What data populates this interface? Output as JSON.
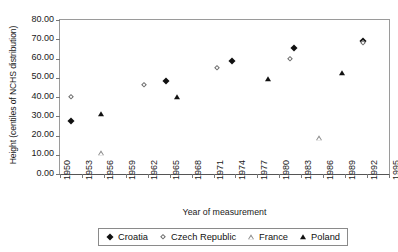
{
  "chart_data": {
    "type": "scatter",
    "title": "",
    "xlabel": "Year of measurement",
    "ylabel": "Height (centiles of NCHS distribution)",
    "xlim": [
      1950,
      1995
    ],
    "ylim": [
      0,
      80
    ],
    "grid": false,
    "legend_position": "bottom",
    "x_ticks": [
      "1950",
      "1953",
      "1956",
      "1959",
      "1962",
      "1965",
      "1968",
      "1971",
      "1974",
      "1977",
      "1980",
      "1983",
      "1986",
      "1989",
      "1992",
      "1995"
    ],
    "y_ticks": [
      "0.00",
      "10.00",
      "20.00",
      "30.00",
      "40.00",
      "50.00",
      "60.00",
      "70.00",
      "80.00"
    ],
    "series": [
      {
        "name": "Croatia",
        "marker": "diamond-filled",
        "color": "#111111",
        "points": [
          {
            "x": 1951.5,
            "y": 27.5
          },
          {
            "x": 1964.5,
            "y": 48.5
          },
          {
            "x": 1973.5,
            "y": 58.5
          },
          {
            "x": 1982.0,
            "y": 65.5
          },
          {
            "x": 1991.5,
            "y": 69.0
          }
        ]
      },
      {
        "name": "Czech Republic",
        "marker": "diamond-open",
        "color": "#6b6b6b",
        "points": [
          {
            "x": 1951.5,
            "y": 40.0
          },
          {
            "x": 1961.5,
            "y": 46.0
          },
          {
            "x": 1971.5,
            "y": 55.0
          },
          {
            "x": 1981.5,
            "y": 59.5
          },
          {
            "x": 1991.5,
            "y": 68.0
          }
        ]
      },
      {
        "name": "France",
        "marker": "triangle-open",
        "color": "#8a8a8a",
        "points": [
          {
            "x": 1955.6,
            "y": 11.0
          },
          {
            "x": 1985.4,
            "y": 18.5
          }
        ]
      },
      {
        "name": "Poland",
        "marker": "triangle-filled",
        "color": "#111111",
        "points": [
          {
            "x": 1955.6,
            "y": 31.0
          },
          {
            "x": 1966.0,
            "y": 40.0
          },
          {
            "x": 1978.5,
            "y": 49.5
          },
          {
            "x": 1988.6,
            "y": 52.5
          }
        ]
      }
    ]
  }
}
